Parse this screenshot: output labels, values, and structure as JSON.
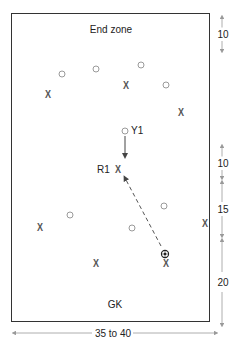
{
  "diagram": {
    "field": {
      "top_label": "End zone",
      "bottom_label": "GK"
    },
    "dimensions": {
      "width_label": "35 to 40",
      "right_labels": [
        "10",
        "10",
        "15",
        "20"
      ]
    },
    "players": {
      "attackers_o": [
        {
          "x": 62,
          "y": 74
        },
        {
          "x": 96,
          "y": 69
        },
        {
          "x": 141,
          "y": 65
        },
        {
          "x": 166,
          "y": 85
        },
        {
          "x": 70,
          "y": 215
        },
        {
          "x": 164,
          "y": 206
        },
        {
          "x": 132,
          "y": 228
        }
      ],
      "defenders_x": [
        {
          "x": 48,
          "y": 95
        },
        {
          "x": 126,
          "y": 86
        },
        {
          "x": 181,
          "y": 113
        },
        {
          "x": 40,
          "y": 228
        },
        {
          "x": 96,
          "y": 264
        },
        {
          "x": 166,
          "y": 264
        },
        {
          "x": 205,
          "y": 224
        }
      ],
      "y1": {
        "x": 125,
        "y": 131,
        "label": "Y1"
      },
      "r1": {
        "x": 118,
        "y": 170,
        "label": "R1"
      },
      "ball": {
        "x": 165,
        "y": 254
      }
    },
    "colors": {
      "field_border": "#333333",
      "o_marker": "#9a9a9a",
      "x_marker": "#555555",
      "dimension_line": "#aaaaaa"
    }
  }
}
